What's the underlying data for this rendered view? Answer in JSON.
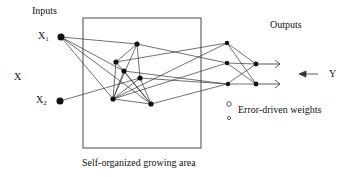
{
  "labels": {
    "inputs": "Inputs",
    "outputs": "Outputs",
    "x": "X",
    "y": "Y",
    "x1_main": "X",
    "x1_sub": "1",
    "x2_main": "X",
    "x2_sub": "2",
    "legend": "Error-driven weights",
    "area": "Self-organized growing area"
  },
  "colors": {
    "line": "#333333",
    "node": "#111111",
    "background": "#ffffff"
  }
}
